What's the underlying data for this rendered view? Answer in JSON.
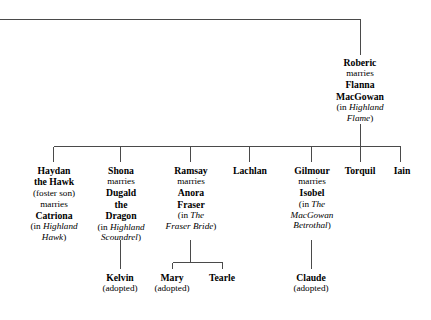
{
  "diagram": {
    "type": "family-tree",
    "line_color": "#4a4a4a",
    "background": "#ffffff"
  },
  "root": {
    "name": "Roberic",
    "relation": "marries",
    "spouse_line1": "Flanna",
    "spouse_line2": "MacGowan",
    "source_prefix": "(in ",
    "book_line1": "Highland",
    "book_line2": "Flame",
    "source_suffix": ")"
  },
  "children": [
    {
      "name_line1": "Haydan",
      "name_line2": "the Hawk",
      "note": "(foster son)",
      "relation": "marries",
      "spouse": "Catriona",
      "source_prefix": "(in ",
      "book_line1": "Highland",
      "book_line2": "Hawk",
      "source_suffix": ")"
    },
    {
      "name_line1": "Shona",
      "relation": "marries",
      "spouse_line1": "Dugald",
      "spouse_line2": "the",
      "spouse_line3": "Dragon",
      "source_prefix": "(in ",
      "book_line1": "Highland",
      "book_line2": "Scoundrel",
      "source_suffix": ")"
    },
    {
      "name_line1": "Ramsay",
      "relation": "marries",
      "spouse_line1": "Anora",
      "spouse_line2": "Fraser",
      "source_prefix": "(in ",
      "book_line1": "The",
      "book_line2": "Fraser Bride",
      "source_suffix": ")"
    },
    {
      "name_line1": "Lachlan"
    },
    {
      "name_line1": "Gilmour",
      "relation": "marries",
      "spouse_line1": "Isobel",
      "source_prefix": "(in ",
      "book_line1": "The",
      "book_line2": "MacGowan",
      "book_line3": "Betrothal",
      "source_suffix": ")"
    },
    {
      "name_line1": "Torquil"
    },
    {
      "name_line1": "Iain"
    }
  ],
  "grandchildren": [
    {
      "name": "Kelvin",
      "note": "(adopted)",
      "parent": "Shona"
    },
    {
      "name": "Mary",
      "note": "(adopted)",
      "parent": "Ramsay"
    },
    {
      "name": "Tearle",
      "note": "",
      "parent": "Ramsay"
    },
    {
      "name": "Claude",
      "note": "(adopted)",
      "parent": "Gilmour"
    }
  ]
}
